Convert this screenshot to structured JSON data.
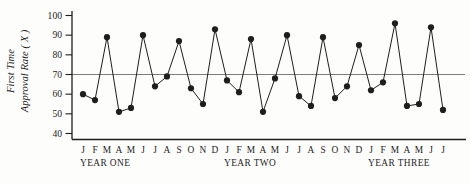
{
  "figure": {
    "background": "#fdfdfc",
    "ink_color": "#1e1e1e",
    "center_line_color": "#6e6e6e"
  },
  "chart_data": {
    "type": "line",
    "title": "",
    "ylabel_lines": [
      "First Time",
      "Approval Rate ( X )"
    ],
    "xlabel": "",
    "ylim": [
      40,
      100
    ],
    "yticks": [
      100,
      90,
      80,
      70,
      60,
      50,
      40
    ],
    "center_line": 70,
    "grid": false,
    "legend": null,
    "marker": "filled-circle",
    "categories": [
      "J",
      "F",
      "M",
      "A",
      "M",
      "J",
      "J",
      "A",
      "S",
      "O",
      "N",
      "D",
      "J",
      "F",
      "M",
      "A",
      "M",
      "J",
      "J",
      "A",
      "S",
      "O",
      "N",
      "D",
      "J",
      "F",
      "M",
      "A",
      "M",
      "J",
      "J"
    ],
    "values": [
      60,
      57,
      89,
      51,
      53,
      90,
      64,
      69,
      87,
      63,
      55,
      93,
      67,
      61,
      88,
      51,
      68,
      90,
      59,
      54,
      89,
      58,
      64,
      85,
      62,
      66,
      96,
      54,
      55,
      94,
      52
    ],
    "year_groups": [
      {
        "label": "YEAR ONE",
        "start": 0,
        "end": 11
      },
      {
        "label": "YEAR TWO",
        "start": 12,
        "end": 23
      },
      {
        "label": "YEAR THREE",
        "start": 24,
        "end": 30
      }
    ]
  }
}
